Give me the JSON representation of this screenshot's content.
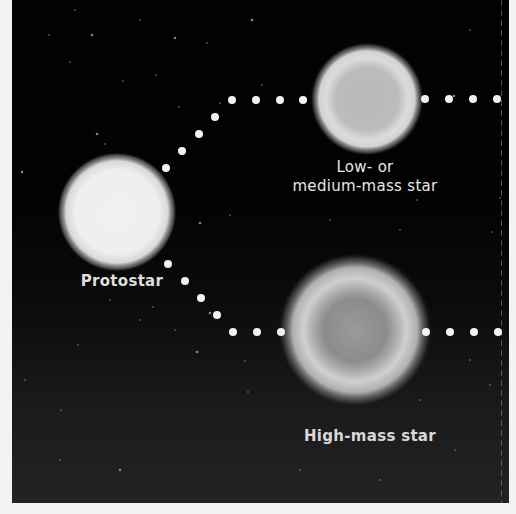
{
  "diagram": {
    "title": "",
    "nodes": {
      "protostar": {
        "label": "Protostar"
      },
      "low_mass_star": {
        "label_line1": "Low- or",
        "label_line2": "medium-mass star"
      },
      "high_mass_star": {
        "label": "High-mass star"
      }
    },
    "edges": [
      {
        "from": "protostar",
        "to": "low_mass_star",
        "style": "dotted",
        "continues_right": true
      },
      {
        "from": "protostar",
        "to": "high_mass_star",
        "style": "dotted",
        "continues_right": true
      }
    ],
    "colors": {
      "background": "#020202",
      "page": "#f3f3f1",
      "dots": "#f2f2f2",
      "label_text": "#e6e6e6",
      "protostar_core": "#f4f4f4",
      "low_mass_core": "#bdbdbd",
      "high_mass_core": "#8a8a8a"
    }
  }
}
